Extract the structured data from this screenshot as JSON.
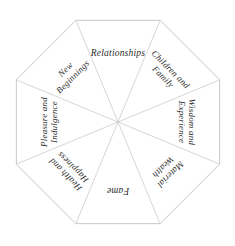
{
  "diagram": {
    "shape": "octagon",
    "segment_count": 8,
    "colors": {
      "background": "#ffffff",
      "outline": "#c2c2c2",
      "spoke": "#cccccc",
      "text": "#2b2b2b"
    },
    "geometry": {
      "center_x": 118,
      "center_y": 122,
      "radius": 110,
      "rotation_deg": 22.5
    },
    "segments": [
      {
        "id": "relationships",
        "label": "Relationships",
        "lines": [
          "Relationships"
        ],
        "angle_deg": 0,
        "position": "top"
      },
      {
        "id": "children-and-family",
        "label": "Children and Family",
        "lines": [
          "Children and",
          "Family"
        ],
        "angle_deg": 45,
        "position": "top-right"
      },
      {
        "id": "wisdom-and-experience",
        "label": "Wisdom and Experience",
        "lines": [
          "Wisdom and",
          "Experience"
        ],
        "angle_deg": 90,
        "position": "right"
      },
      {
        "id": "material-wealth",
        "label": "Material Wealth",
        "lines": [
          "Material",
          "Wealth"
        ],
        "angle_deg": 135,
        "position": "bottom-right"
      },
      {
        "id": "fame",
        "label": "Fame",
        "lines": [
          "Fame"
        ],
        "angle_deg": 180,
        "position": "bottom"
      },
      {
        "id": "health-and-happiness",
        "label": "Health and Happiness",
        "lines": [
          "Health and",
          "Happiness"
        ],
        "angle_deg": 225,
        "position": "bottom-left"
      },
      {
        "id": "pleasure-and-indulgence",
        "label": "Pleasure and Indulgence",
        "lines": [
          "Pleasure and",
          "Indulgence"
        ],
        "angle_deg": 270,
        "position": "left"
      },
      {
        "id": "new-beginnings",
        "label": "New Beginnings",
        "lines": [
          "New",
          "Beginnings"
        ],
        "angle_deg": 315,
        "position": "top-left"
      }
    ]
  }
}
